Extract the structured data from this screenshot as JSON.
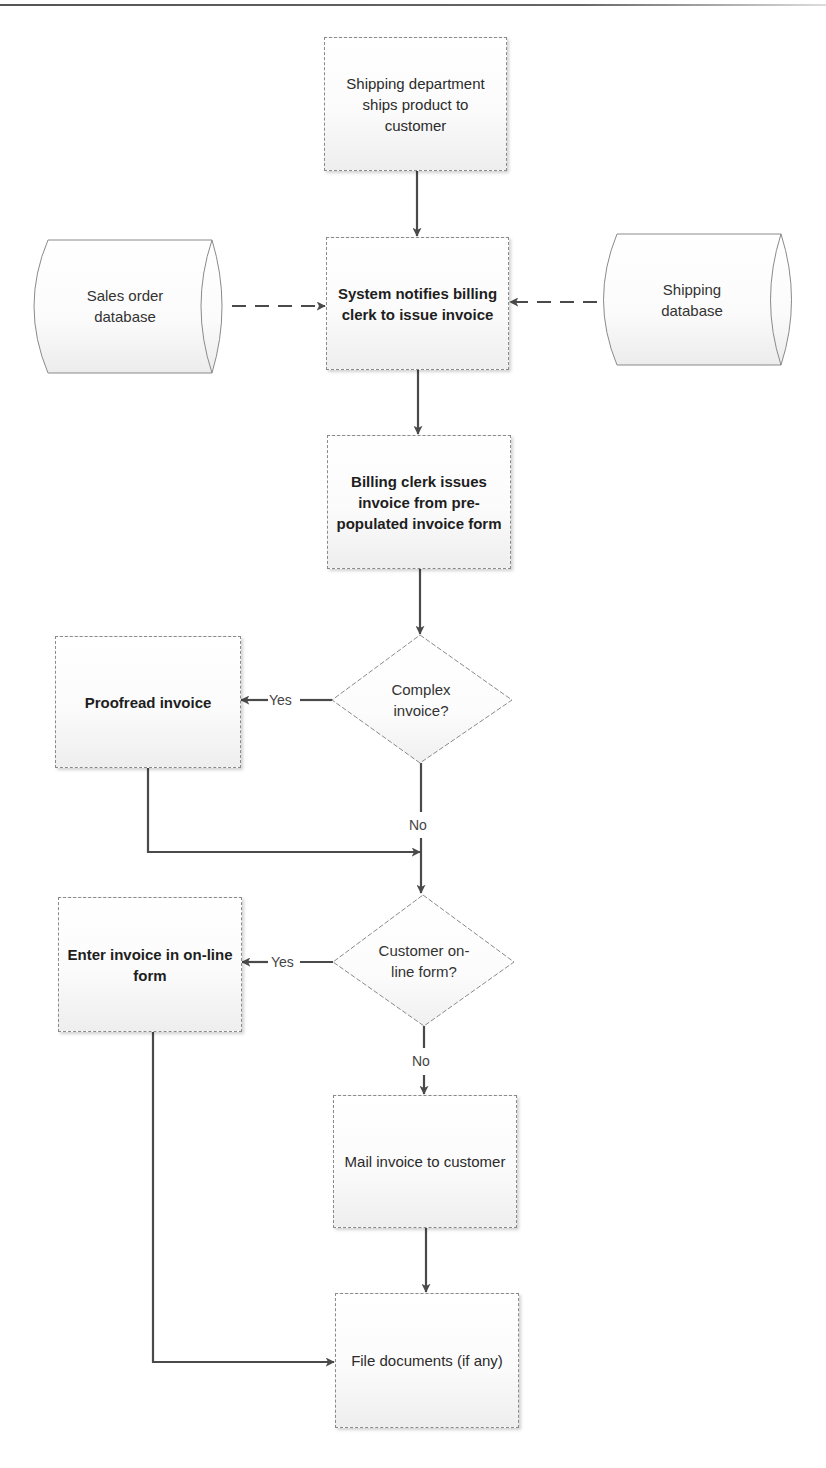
{
  "diagram": {
    "type": "flowchart",
    "nodes": {
      "ship_product": {
        "kind": "process",
        "label": "Shipping department ships product to customer",
        "bold": false
      },
      "sales_db": {
        "kind": "database",
        "label": "Sales order database"
      },
      "notify": {
        "kind": "process",
        "label": "System notifies billing clerk to issue invoice",
        "bold": true
      },
      "shipping_db": {
        "kind": "database",
        "label": "Shipping database"
      },
      "issue_invoice": {
        "kind": "process",
        "label": "Billing clerk issues invoice from  pre-populated invoice form",
        "bold": true
      },
      "complex_decision": {
        "kind": "decision",
        "label": "Complex invoice?"
      },
      "proofread": {
        "kind": "process",
        "label": "Proofread invoice",
        "bold": true
      },
      "online_decision": {
        "kind": "decision",
        "label": "Customer on-line form?"
      },
      "enter_online": {
        "kind": "process",
        "label": "Enter invoice in on-line form",
        "bold": true
      },
      "mail_invoice": {
        "kind": "process",
        "label": "Mail invoice to customer",
        "bold": false
      },
      "file_docs": {
        "kind": "process",
        "label": "File documents (if any)",
        "bold": false
      }
    },
    "edge_labels": {
      "complex_yes": "Yes",
      "complex_no": "No",
      "online_yes": "Yes",
      "online_no": "No"
    },
    "edges": [
      {
        "from": "ship_product",
        "to": "notify",
        "style": "solid"
      },
      {
        "from": "sales_db",
        "to": "notify",
        "style": "dashed"
      },
      {
        "from": "shipping_db",
        "to": "notify",
        "style": "dashed"
      },
      {
        "from": "notify",
        "to": "issue_invoice",
        "style": "solid"
      },
      {
        "from": "issue_invoice",
        "to": "complex_decision",
        "style": "solid"
      },
      {
        "from": "complex_decision",
        "to": "proofread",
        "label": "Yes",
        "style": "solid"
      },
      {
        "from": "complex_decision",
        "to": "online_decision",
        "label": "No",
        "style": "solid"
      },
      {
        "from": "proofread",
        "to": "online_decision",
        "style": "solid"
      },
      {
        "from": "online_decision",
        "to": "enter_online",
        "label": "Yes",
        "style": "solid"
      },
      {
        "from": "online_decision",
        "to": "mail_invoice",
        "label": "No",
        "style": "solid"
      },
      {
        "from": "mail_invoice",
        "to": "file_docs",
        "style": "solid"
      },
      {
        "from": "enter_online",
        "to": "file_docs",
        "style": "solid"
      }
    ],
    "colors": {
      "stroke": "#4a4a4a",
      "shape_border": "#8a8a8a",
      "fill_top": "#ffffff",
      "fill_bottom": "#eeeeee"
    }
  }
}
